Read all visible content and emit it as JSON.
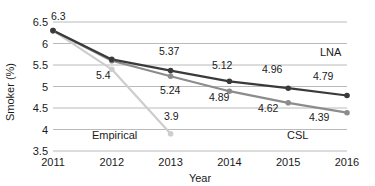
{
  "chart_data": {
    "type": "line",
    "title": "",
    "xlabel": "Year",
    "ylabel": "Smoker (%)",
    "categories": [
      "2011",
      "2012",
      "2013",
      "2014",
      "2015",
      "2016"
    ],
    "x": [
      2011,
      2012,
      2013,
      2014,
      2015,
      2016
    ],
    "xlim": [
      2011,
      2016
    ],
    "ylim": [
      3.5,
      6.5
    ],
    "yticks": [
      "3.5",
      "4",
      "4.5",
      "5",
      "5.5",
      "6",
      "6.5"
    ],
    "ytick_values": [
      3.5,
      4,
      4.5,
      5,
      5.5,
      6,
      6.5
    ],
    "grid": "horizontal",
    "legend_position": "inline-annotations",
    "series": [
      {
        "name": "LNA",
        "color": "#3a3a3a",
        "values": [
          6.3,
          5.63,
          5.37,
          5.12,
          4.96,
          4.79
        ],
        "point_labels": [
          "6.3",
          "",
          "5.37",
          "5.12",
          "4.96",
          "4.79"
        ]
      },
      {
        "name": "CSL",
        "color": "#8c8c8c",
        "values": [
          6.3,
          5.6,
          5.24,
          4.89,
          4.62,
          4.39
        ],
        "point_labels": [
          "",
          "",
          "5.24",
          "4.89",
          "4.62",
          "4.39"
        ]
      },
      {
        "name": "Empirical",
        "color": "#cdcdcd",
        "values": [
          6.3,
          5.4,
          3.9,
          null,
          null,
          null
        ],
        "point_labels": [
          "",
          "5.4",
          "3.9",
          "",
          "",
          ""
        ]
      }
    ],
    "annotations": [
      {
        "text": "6.3",
        "x": 51,
        "y": 20
      },
      {
        "text": "5.4",
        "x": 96,
        "y": 79
      },
      {
        "text": "5.37",
        "x": 159,
        "y": 55
      },
      {
        "text": "5.24",
        "x": 160,
        "y": 94
      },
      {
        "text": "3.9",
        "x": 164,
        "y": 120
      },
      {
        "text": "5.12",
        "x": 212,
        "y": 69
      },
      {
        "text": "4.89",
        "x": 209,
        "y": 101
      },
      {
        "text": "4.96",
        "x": 262,
        "y": 73
      },
      {
        "text": "4.62",
        "x": 258,
        "y": 112
      },
      {
        "text": "4.79",
        "x": 313,
        "y": 80
      },
      {
        "text": "4.39",
        "x": 309,
        "y": 121
      }
    ],
    "series_annotations": [
      {
        "text": "Empirical",
        "x": 92,
        "y": 139
      },
      {
        "text": "CSL",
        "x": 287,
        "y": 139
      },
      {
        "text": "LNA",
        "x": 320,
        "y": 56
      }
    ]
  }
}
